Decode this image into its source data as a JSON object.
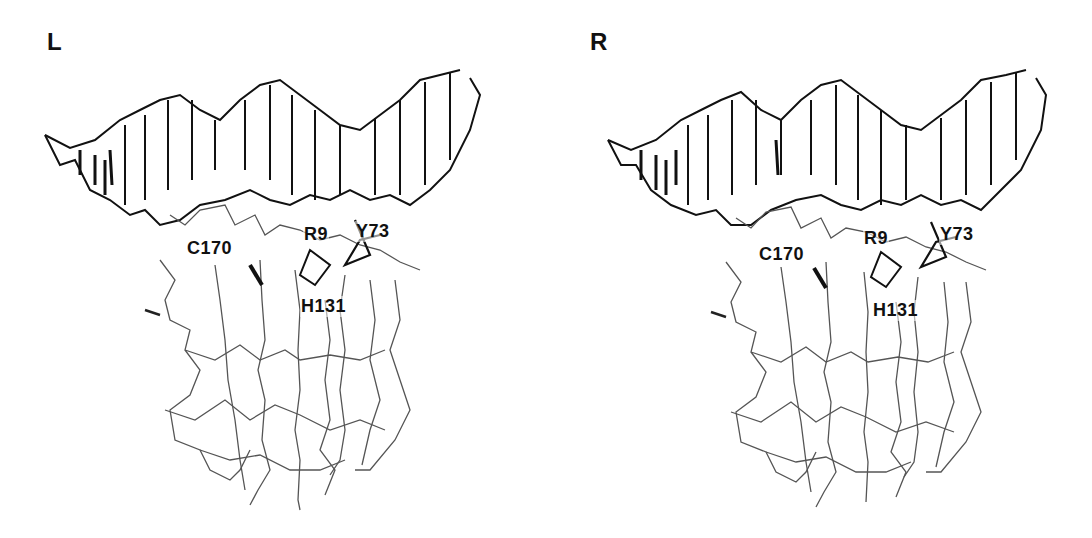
{
  "figure": {
    "panels": [
      {
        "id": "left",
        "letter": "L",
        "labels": [
          {
            "text": "C170",
            "x": 186,
            "y": 238
          },
          {
            "text": "R9",
            "x": 303,
            "y": 224
          },
          {
            "text": "Y73",
            "x": 355,
            "y": 221
          },
          {
            "text": "H131",
            "x": 300,
            "y": 296
          }
        ]
      },
      {
        "id": "right",
        "letter": "R",
        "labels": [
          {
            "text": "C170",
            "x": 212,
            "y": 244
          },
          {
            "text": "R9",
            "x": 317,
            "y": 228
          },
          {
            "text": "Y73",
            "x": 393,
            "y": 224
          },
          {
            "text": "H131",
            "x": 326,
            "y": 300
          }
        ]
      }
    ],
    "colors": {
      "background": "#ffffff",
      "dna": "#111111",
      "protein": "#555555",
      "text": "#111111"
    }
  }
}
